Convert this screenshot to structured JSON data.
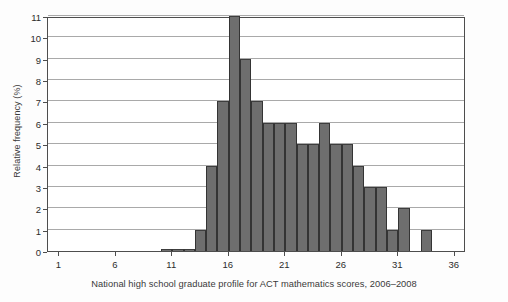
{
  "figure": {
    "caption": "National high school graduate profile for ACT mathematics scores, 2006–2008",
    "ylabel": "Relative frequency (%)",
    "bar_color": "#6e6e6e",
    "grid_color": "#a9a9a9",
    "axis_color": "#4d4d4d"
  },
  "chart_data": {
    "type": "bar",
    "title": "",
    "subtitle": "",
    "caption": "National high school graduate profile for ACT mathematics scores, 2006–2008",
    "xlabel": "",
    "ylabel": "Relative frequency (%)",
    "xlim": [
      0,
      37
    ],
    "ylim": [
      0,
      11
    ],
    "grid": true,
    "legend": null,
    "xticks": [
      1,
      6,
      11,
      16,
      21,
      26,
      31,
      36
    ],
    "yticks": [
      0,
      1,
      2,
      3,
      4,
      5,
      6,
      7,
      8,
      9,
      10,
      11
    ],
    "bin_width": 1,
    "categories": [
      10,
      11,
      12,
      13,
      14,
      15,
      16,
      17,
      18,
      19,
      20,
      21,
      22,
      23,
      24,
      25,
      26,
      27,
      28,
      29,
      30,
      31,
      32,
      33
    ],
    "values": [
      0.1,
      0.1,
      0.1,
      1,
      4,
      7,
      11,
      9,
      7,
      6,
      6,
      6,
      5,
      5,
      6,
      5,
      5,
      4,
      3,
      3,
      1,
      2,
      0,
      1
    ]
  },
  "ytick_labels": [
    "0",
    "1",
    "2",
    "3",
    "4",
    "5",
    "6",
    "7",
    "8",
    "9",
    "10",
    "11"
  ],
  "xtick_labels": [
    "1",
    "6",
    "11",
    "16",
    "21",
    "26",
    "31",
    "36"
  ]
}
